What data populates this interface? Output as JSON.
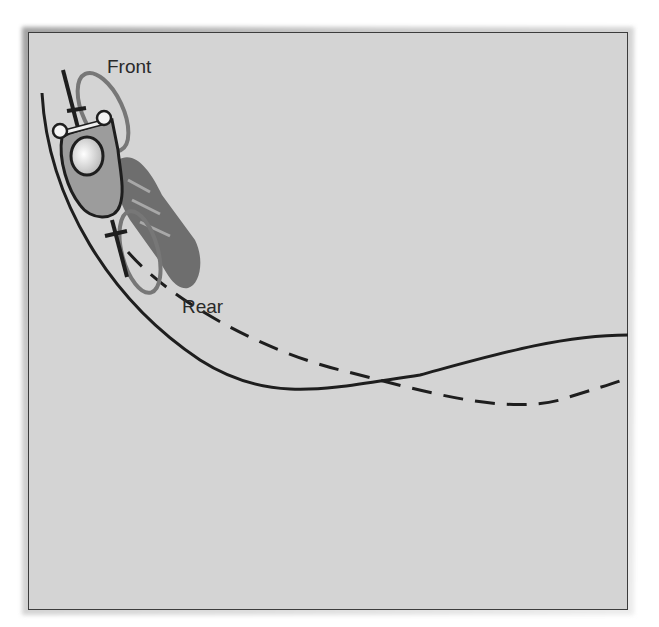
{
  "figure": {
    "labels": {
      "front": "Front",
      "rear": "Rear"
    },
    "colors": {
      "background": "#d4d4d4",
      "frame_border": "#3c3c3c",
      "track_line": "#1e1e1e",
      "rider_body": "#9c9c9c",
      "bike_shadow": "#6e6e6e",
      "wheel_outline": "#777777"
    },
    "legend": {
      "solid_line": "front wheel track",
      "dashed_line": "rear wheel track"
    }
  }
}
